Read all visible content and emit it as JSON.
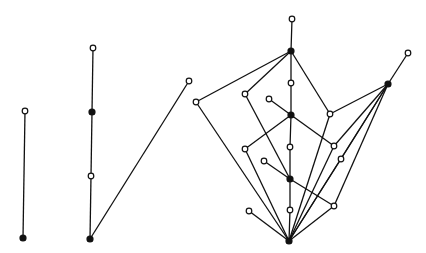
{
  "diagram": {
    "colors": {
      "line": "#111111",
      "background": "#ffffff",
      "open_fill": "#ffffff",
      "filled_fill": "#111111"
    },
    "graphs": [
      {
        "name": "graph-1",
        "nodes": [
          {
            "id": "a1",
            "x": 25,
            "y": 111,
            "type": "open"
          },
          {
            "id": "a2",
            "x": 23,
            "y": 238,
            "type": "filled"
          }
        ],
        "edges": [
          [
            "a1",
            "a2"
          ]
        ]
      },
      {
        "name": "graph-2",
        "nodes": [
          {
            "id": "b1",
            "x": 93,
            "y": 48,
            "type": "open"
          },
          {
            "id": "b2",
            "x": 92,
            "y": 112,
            "type": "filled"
          },
          {
            "id": "b3",
            "x": 91,
            "y": 176,
            "type": "open"
          },
          {
            "id": "b4",
            "x": 90,
            "y": 239,
            "type": "filled"
          },
          {
            "id": "b5",
            "x": 189,
            "y": 81,
            "type": "open"
          }
        ],
        "edges": [
          [
            "b1",
            "b2"
          ],
          [
            "b2",
            "b3"
          ],
          [
            "b3",
            "b4"
          ],
          [
            "b4",
            "b5"
          ]
        ]
      },
      {
        "name": "graph-3",
        "nodes": [
          {
            "id": "c1",
            "x": 292,
            "y": 19,
            "type": "open"
          },
          {
            "id": "c2",
            "x": 291,
            "y": 51,
            "type": "filled"
          },
          {
            "id": "c3",
            "x": 291,
            "y": 83,
            "type": "open"
          },
          {
            "id": "c4",
            "x": 196,
            "y": 102,
            "type": "open"
          },
          {
            "id": "c5",
            "x": 245,
            "y": 94,
            "type": "open"
          },
          {
            "id": "c6",
            "x": 269,
            "y": 99,
            "type": "open"
          },
          {
            "id": "c7",
            "x": 291,
            "y": 115,
            "type": "filled"
          },
          {
            "id": "c8",
            "x": 330,
            "y": 114,
            "type": "open"
          },
          {
            "id": "c9",
            "x": 388,
            "y": 84,
            "type": "filled"
          },
          {
            "id": "c10",
            "x": 408,
            "y": 53,
            "type": "open"
          },
          {
            "id": "c11",
            "x": 245,
            "y": 149,
            "type": "open"
          },
          {
            "id": "c12",
            "x": 290,
            "y": 147,
            "type": "open"
          },
          {
            "id": "c13",
            "x": 334,
            "y": 146,
            "type": "open"
          },
          {
            "id": "c14",
            "x": 341,
            "y": 159,
            "type": "open"
          },
          {
            "id": "c15",
            "x": 264,
            "y": 161,
            "type": "open"
          },
          {
            "id": "c16",
            "x": 290,
            "y": 179,
            "type": "filled"
          },
          {
            "id": "c17",
            "x": 290,
            "y": 210,
            "type": "open"
          },
          {
            "id": "c18",
            "x": 334,
            "y": 206,
            "type": "open"
          },
          {
            "id": "c19",
            "x": 249,
            "y": 211,
            "type": "open"
          },
          {
            "id": "c20",
            "x": 289,
            "y": 241,
            "type": "filled"
          }
        ],
        "edges": [
          [
            "c1",
            "c2"
          ],
          [
            "c2",
            "c4"
          ],
          [
            "c2",
            "c5"
          ],
          [
            "c2",
            "c3"
          ],
          [
            "c2",
            "c8"
          ],
          [
            "c3",
            "c7"
          ],
          [
            "c6",
            "c7"
          ],
          [
            "c7",
            "c11"
          ],
          [
            "c7",
            "c13"
          ],
          [
            "c7",
            "c12"
          ],
          [
            "c5",
            "c16"
          ],
          [
            "c4",
            "c20"
          ],
          [
            "c12",
            "c16"
          ],
          [
            "c15",
            "c16"
          ],
          [
            "c16",
            "c18"
          ],
          [
            "c16",
            "c17"
          ],
          [
            "c17",
            "c20"
          ],
          [
            "c11",
            "c20"
          ],
          [
            "c19",
            "c20"
          ],
          [
            "c18",
            "c20"
          ],
          [
            "c8",
            "c20"
          ],
          [
            "c13",
            "c20"
          ],
          [
            "c14",
            "c20"
          ],
          [
            "c9",
            "c10"
          ],
          [
            "c9",
            "c8"
          ],
          [
            "c9",
            "c13"
          ],
          [
            "c9",
            "c14"
          ],
          [
            "c9",
            "c18"
          ],
          [
            "c9",
            "c20"
          ]
        ]
      }
    ]
  }
}
